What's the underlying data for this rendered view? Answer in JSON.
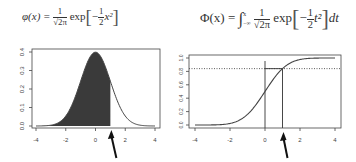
{
  "formulas": {
    "pdf": {
      "lhs": "φ(x) =",
      "frac_num": "1",
      "frac_den": "√2π",
      "exp": "exp",
      "inner_frac_num": "1",
      "inner_frac_den": "2",
      "inner_tail": "x²",
      "minus": "−"
    },
    "cdf": {
      "lhs": "Φ(x) =",
      "integral": "∫",
      "upper": "x",
      "lower": "−∞",
      "frac_num": "1",
      "frac_den": "√2π",
      "exp": "exp",
      "inner_frac_num": "1",
      "inner_frac_den": "2",
      "inner_tail": "t²",
      "minus": "−",
      "dt": "dt"
    }
  },
  "chart_data": [
    {
      "type": "area",
      "title": "Standard normal density φ(x), area shaded up to x = 1",
      "xlabel": "",
      "ylabel": "",
      "xlim": [
        -4,
        4
      ],
      "ylim": [
        0,
        0.4
      ],
      "x_ticks": [
        "-4",
        "-2",
        "0",
        "2",
        "4"
      ],
      "y_ticks": [
        "0.0",
        "0.1",
        "0.2",
        "0.3",
        "0.4"
      ],
      "shaded_upto": 1,
      "arrow_at_x": 1,
      "x": [
        -4,
        -3,
        -2,
        -1,
        0,
        1,
        2,
        3,
        4
      ],
      "values": [
        0.0001,
        0.0044,
        0.054,
        0.242,
        0.399,
        0.242,
        0.054,
        0.0044,
        0.0001
      ],
      "grid": false,
      "fill_color": "#3a3a3a"
    },
    {
      "type": "line",
      "title": "Standard normal CDF Φ(x)",
      "xlabel": "",
      "ylabel": "",
      "xlim": [
        -4,
        4
      ],
      "ylim": [
        0,
        1
      ],
      "x_ticks": [
        "-4",
        "-2",
        "0",
        "2",
        "4"
      ],
      "y_ticks": [
        "0.0",
        "0.2",
        "0.4",
        "0.6",
        "0.8",
        "1.0"
      ],
      "x": [
        -4,
        -3,
        -2,
        -1,
        0,
        1,
        2,
        3,
        4
      ],
      "values": [
        3e-05,
        0.0013,
        0.0228,
        0.1587,
        0.5,
        0.8413,
        0.9772,
        0.9987,
        0.99997
      ],
      "reference_lines": {
        "vertical_x": [
          0,
          1
        ],
        "horizontal_dotted_y": 0.8413
      },
      "arrow_at_x": 1,
      "grid": false
    }
  ]
}
